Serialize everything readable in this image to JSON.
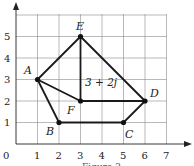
{
  "diagram": {
    "x_ticks": [
      "0",
      "1",
      "2",
      "3",
      "4",
      "5",
      "6",
      "7"
    ],
    "y_ticks": [
      "1",
      "2",
      "3",
      "4",
      "5"
    ],
    "points": [
      {
        "name": "A",
        "x": 1,
        "y": 3
      },
      {
        "name": "B",
        "x": 2,
        "y": 1
      },
      {
        "name": "C",
        "x": 5,
        "y": 1
      },
      {
        "name": "D",
        "x": 6,
        "y": 2
      },
      {
        "name": "E",
        "x": 3,
        "y": 5
      },
      {
        "name": "F",
        "x": 3,
        "y": 2
      }
    ],
    "edges": [
      [
        "A",
        "E"
      ],
      [
        "E",
        "D"
      ],
      [
        "D",
        "C"
      ],
      [
        "C",
        "B"
      ],
      [
        "B",
        "A"
      ],
      [
        "A",
        "F"
      ],
      [
        "F",
        "D"
      ],
      [
        "E",
        "F"
      ]
    ],
    "annotation": "3 + 2j",
    "caption": "Figure 3"
  }
}
